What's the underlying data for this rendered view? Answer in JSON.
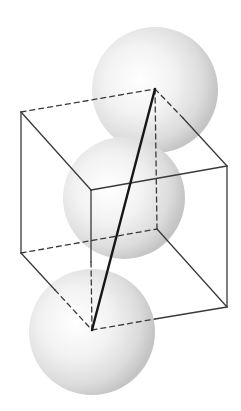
{
  "figure": {
    "colors": {
      "background": "#ffffff",
      "edge": "#3a3a3a",
      "diagonal": "#161616",
      "sphere_light": "#ffffff",
      "sphere_mid": "#e6e6e6",
      "sphere_dark": "#bdbdbd"
    },
    "atoms": [
      {
        "id": "top",
        "position": "back-top-right corner"
      },
      {
        "id": "center",
        "position": "cube center"
      },
      {
        "id": "bottom",
        "position": "back-bottom-left corner"
      }
    ],
    "edges": [
      {
        "id": "top-back",
        "style": "dashed"
      },
      {
        "id": "top-right",
        "style": "dashed-then-solid"
      },
      {
        "id": "top-left",
        "style": "solid"
      },
      {
        "id": "top-front",
        "style": "solid"
      },
      {
        "id": "vertical-back-left",
        "style": "solid"
      },
      {
        "id": "vertical-back-right",
        "style": "dashed"
      },
      {
        "id": "vertical-front-left",
        "style": "solid-then-dashed"
      },
      {
        "id": "vertical-front-right",
        "style": "solid"
      },
      {
        "id": "bottom-back",
        "style": "dashed"
      },
      {
        "id": "bottom-right",
        "style": "solid"
      },
      {
        "id": "bottom-left",
        "style": "solid-then-dashed"
      },
      {
        "id": "bottom-front",
        "style": "dashed-then-solid"
      }
    ],
    "diagonal": {
      "id": "body-diagonal",
      "style": "bold"
    }
  }
}
